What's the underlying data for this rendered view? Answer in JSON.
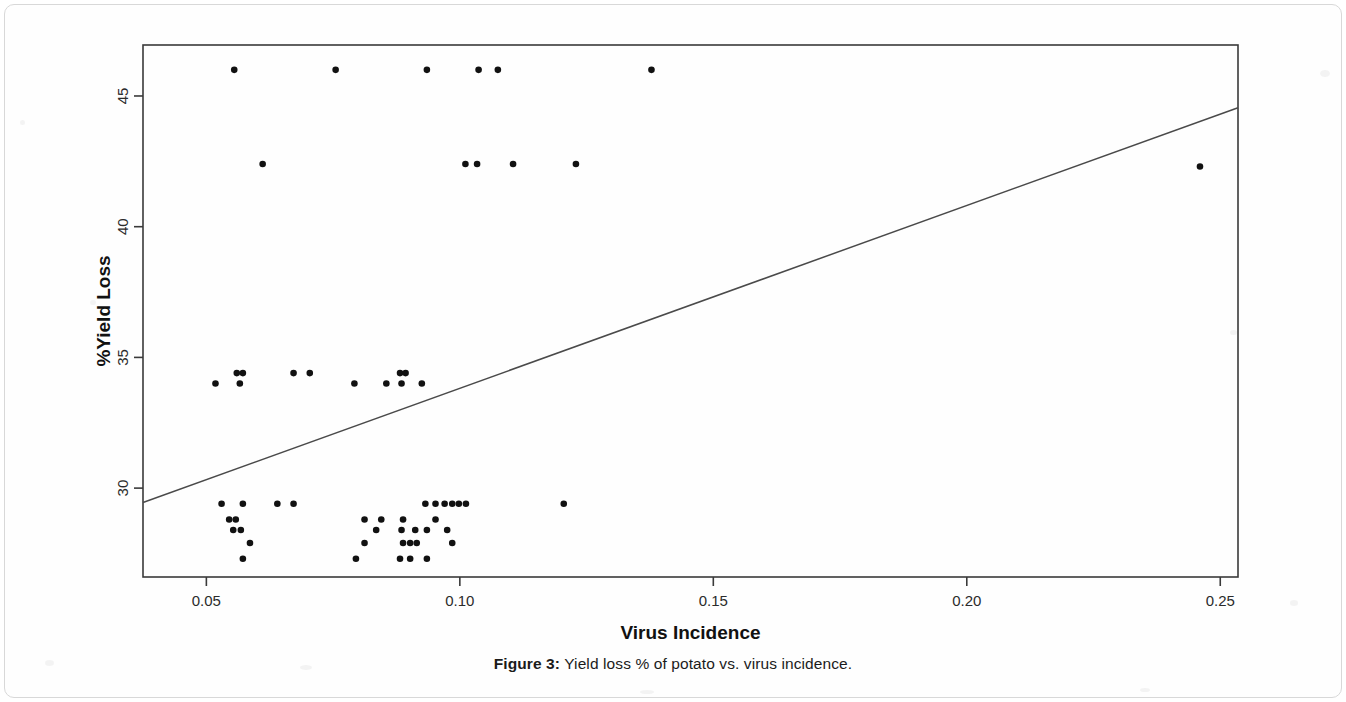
{
  "figure": {
    "caption_label": "Figure 3:",
    "caption_text": " Yield loss % of potato vs. virus incidence.",
    "axis_color": "#3a3a3a",
    "point_color": "#111111",
    "line_color": "#4a4a4a"
  },
  "chart_data": {
    "type": "scatter",
    "title": "",
    "xlabel": "Virus Incidence",
    "ylabel": "%Yield Loss",
    "xlim": [
      0.0375,
      0.2535
    ],
    "ylim": [
      26.6,
      46.95
    ],
    "grid": false,
    "legend": "none",
    "xticks": [
      0.05,
      0.1,
      0.15,
      0.2,
      0.25
    ],
    "xtick_labels": [
      "0.05",
      "0.10",
      "0.15",
      "0.20",
      "0.25"
    ],
    "yticks": [
      30,
      35,
      40,
      45
    ],
    "ytick_labels": [
      "30",
      "35",
      "40",
      "45"
    ],
    "points": [
      [
        0.0555,
        46.0
      ],
      [
        0.0755,
        46.0
      ],
      [
        0.0935,
        46.0
      ],
      [
        0.1037,
        46.0
      ],
      [
        0.1075,
        46.0
      ],
      [
        0.1378,
        46.0
      ],
      [
        0.0611,
        42.4
      ],
      [
        0.1011,
        42.4
      ],
      [
        0.1034,
        42.4
      ],
      [
        0.1105,
        42.4
      ],
      [
        0.1229,
        42.4
      ],
      [
        0.246,
        42.3
      ],
      [
        0.0518,
        34.0
      ],
      [
        0.056,
        34.4
      ],
      [
        0.0572,
        34.4
      ],
      [
        0.0566,
        34.0
      ],
      [
        0.0672,
        34.4
      ],
      [
        0.0704,
        34.4
      ],
      [
        0.0792,
        34.0
      ],
      [
        0.0855,
        34.0
      ],
      [
        0.0882,
        34.4
      ],
      [
        0.0893,
        34.4
      ],
      [
        0.0885,
        34.0
      ],
      [
        0.0925,
        34.0
      ],
      [
        0.053,
        29.4
      ],
      [
        0.0572,
        29.4
      ],
      [
        0.064,
        29.4
      ],
      [
        0.0672,
        29.4
      ],
      [
        0.0545,
        28.8
      ],
      [
        0.0558,
        28.8
      ],
      [
        0.0553,
        28.4
      ],
      [
        0.0568,
        28.4
      ],
      [
        0.0586,
        27.9
      ],
      [
        0.0572,
        27.3
      ],
      [
        0.0812,
        28.8
      ],
      [
        0.0845,
        28.8
      ],
      [
        0.0835,
        28.4
      ],
      [
        0.0812,
        27.9
      ],
      [
        0.0795,
        27.3
      ],
      [
        0.0888,
        28.8
      ],
      [
        0.0885,
        28.4
      ],
      [
        0.0912,
        28.4
      ],
      [
        0.0935,
        28.4
      ],
      [
        0.0888,
        27.9
      ],
      [
        0.0902,
        27.9
      ],
      [
        0.0915,
        27.9
      ],
      [
        0.0882,
        27.3
      ],
      [
        0.0902,
        27.3
      ],
      [
        0.0935,
        27.3
      ],
      [
        0.0932,
        29.4
      ],
      [
        0.0952,
        29.4
      ],
      [
        0.097,
        29.4
      ],
      [
        0.0985,
        29.4
      ],
      [
        0.0998,
        29.4
      ],
      [
        0.1012,
        29.4
      ],
      [
        0.0952,
        28.8
      ],
      [
        0.0975,
        28.4
      ],
      [
        0.0985,
        27.9
      ],
      [
        0.1205,
        29.4
      ]
    ],
    "trendline": {
      "label": "linear fit",
      "x": [
        0.0375,
        0.2535
      ],
      "y": [
        29.45,
        44.55
      ]
    }
  }
}
